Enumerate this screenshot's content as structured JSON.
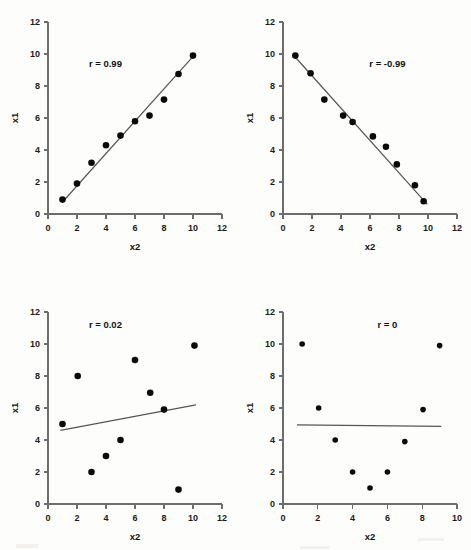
{
  "figure": {
    "background_color": "#fdfdfb",
    "point_color": "#0a0a0a",
    "line_color": "#555555",
    "axis_color": "#6d6d6d"
  },
  "chart_data": [
    {
      "type": "scatter",
      "panel_index": 0,
      "annotation": "r = 0.99",
      "r_value": 0.99,
      "xlabel": "x2",
      "ylabel": "x1",
      "xlim": [
        0,
        12
      ],
      "ylim": [
        0,
        12
      ],
      "xticks": [
        0,
        2,
        4,
        6,
        8,
        10,
        12
      ],
      "yticks": [
        0,
        2,
        4,
        6,
        8,
        10,
        12
      ],
      "grid": false,
      "legend": "none",
      "x": [
        1,
        2,
        3,
        4,
        5,
        6,
        7,
        8,
        9,
        10
      ],
      "y": [
        0.9,
        1.9,
        3.2,
        4.3,
        4.9,
        5.8,
        6.15,
        7.15,
        8.75,
        9.9
      ],
      "trendline": {
        "x0": 1.0,
        "y0": 0.75,
        "x1": 10.1,
        "y1": 9.95
      }
    },
    {
      "type": "scatter",
      "panel_index": 1,
      "annotation": "r = -0.99",
      "r_value": -0.99,
      "xlabel": "x2",
      "ylabel": "x1",
      "xlim": [
        0,
        12
      ],
      "ylim": [
        0,
        12
      ],
      "xticks": [
        0,
        2,
        4,
        6,
        8,
        10,
        12
      ],
      "yticks": [
        0,
        2,
        4,
        6,
        8,
        10,
        12
      ],
      "grid": false,
      "legend": "none",
      "x": [
        0.85,
        1.9,
        2.85,
        4.15,
        4.8,
        6.2,
        7.1,
        7.85,
        9.1,
        9.7
      ],
      "y": [
        9.9,
        8.8,
        7.15,
        6.15,
        5.75,
        4.85,
        4.2,
        3.1,
        1.8,
        0.8
      ],
      "trendline": {
        "x0": 0.9,
        "y0": 9.75,
        "x1": 9.95,
        "y1": 0.6
      }
    },
    {
      "type": "scatter",
      "panel_index": 2,
      "annotation": "r = 0.02",
      "r_value": 0.02,
      "xlabel": "x2",
      "ylabel": "x1",
      "xlim": [
        0,
        12
      ],
      "ylim": [
        0,
        12
      ],
      "xticks": [
        0,
        2,
        4,
        6,
        8,
        10,
        12
      ],
      "yticks": [
        0,
        2,
        4,
        6,
        8,
        10,
        12
      ],
      "grid": false,
      "legend": "none",
      "x": [
        1,
        2.05,
        3,
        4,
        5,
        6,
        7.05,
        8,
        9,
        10.1
      ],
      "y": [
        5.0,
        8.0,
        2.0,
        3.0,
        4.0,
        9.0,
        6.95,
        5.9,
        0.9,
        9.9
      ],
      "trendline": {
        "x0": 0.85,
        "y0": 4.6,
        "x1": 10.2,
        "y1": 6.2
      }
    },
    {
      "type": "scatter",
      "panel_index": 3,
      "annotation": "r = 0",
      "r_value": 0,
      "xlabel": "x2",
      "ylabel": "x1",
      "xlim": [
        0,
        10
      ],
      "ylim": [
        0,
        12
      ],
      "xticks": [
        0,
        2,
        4,
        6,
        8,
        10
      ],
      "yticks": [
        0,
        2,
        4,
        6,
        8,
        10,
        12
      ],
      "grid": false,
      "legend": "none",
      "x": [
        1.1,
        2.05,
        3,
        4,
        5,
        6,
        7,
        8.05,
        9
      ],
      "y": [
        10.0,
        6.0,
        4.0,
        2.0,
        1.0,
        2.0,
        3.9,
        5.9,
        9.9
      ],
      "trendline": {
        "x0": 0.8,
        "y0": 4.95,
        "x1": 9.1,
        "y1": 4.85
      }
    }
  ]
}
